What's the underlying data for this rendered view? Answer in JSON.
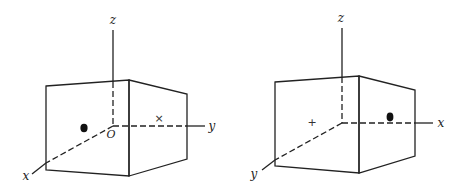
{
  "figures": [
    {
      "id": "left",
      "axis_labels": {
        "vertical": "z",
        "right": "y",
        "front": "x"
      },
      "origin_label": "O",
      "dot": "filled-point",
      "marker": "×",
      "description": "Box with right-handed axes, point charge on front face, cross marker on right face"
    },
    {
      "id": "right",
      "axis_labels": {
        "vertical": "z",
        "right": "x",
        "front": "y"
      },
      "origin_label": "",
      "dot": "filled-point",
      "marker": "+",
      "description": "Box with swapped horizontal axes, cross marker on front face, point charge on right face"
    }
  ],
  "colors": {
    "ink": "#222222",
    "background": "#ffffff"
  }
}
